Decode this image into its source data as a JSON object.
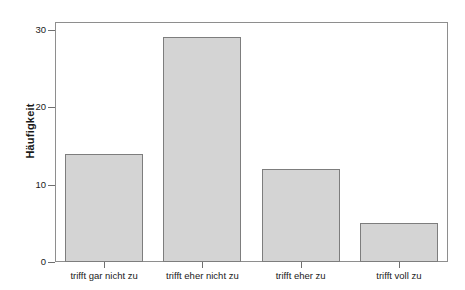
{
  "chart_data": {
    "type": "bar",
    "title": "",
    "xlabel": "",
    "ylabel": "Häufigkeit",
    "categories": [
      "trifft gar nicht zu",
      "trifft eher nicht zu",
      "trifft eher zu",
      "trifft voll zu"
    ],
    "values": [
      14,
      29,
      12,
      5
    ],
    "ylim": [
      0,
      31
    ],
    "yticks": [
      0,
      10,
      20,
      30
    ],
    "ytick_labels": [
      "0",
      "10",
      "20",
      "30"
    ],
    "grid": false,
    "legend": null,
    "bar_color": "#d4d4d4",
    "bar_edge_color": "#7d7d7d",
    "frame_color": "#8e8e8e",
    "background": "#ffffff"
  }
}
